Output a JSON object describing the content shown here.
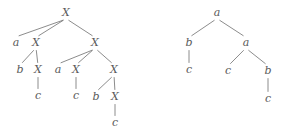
{
  "figure": {
    "background_color": "#ffffff",
    "ink_color": "#5a5a5a",
    "edge_color": "#6e6e6e"
  },
  "trees": [
    {
      "name": "left-tree",
      "nodes": [
        {
          "id": "L0",
          "label": "X",
          "x": 66,
          "y": 13
        },
        {
          "id": "L1",
          "label": "a",
          "x": 16,
          "y": 43
        },
        {
          "id": "L2",
          "label": "X",
          "x": 36,
          "y": 43
        },
        {
          "id": "L3",
          "label": "X",
          "x": 95,
          "y": 43
        },
        {
          "id": "L4",
          "label": "b",
          "x": 20,
          "y": 70
        },
        {
          "id": "L5",
          "label": "X",
          "x": 38,
          "y": 70
        },
        {
          "id": "L6",
          "label": "c",
          "x": 38,
          "y": 96
        },
        {
          "id": "L7",
          "label": "a",
          "x": 58,
          "y": 70
        },
        {
          "id": "L8",
          "label": "X",
          "x": 76,
          "y": 70
        },
        {
          "id": "L9",
          "label": "c",
          "x": 76,
          "y": 96
        },
        {
          "id": "L10",
          "label": "X",
          "x": 114,
          "y": 70
        },
        {
          "id": "L11",
          "label": "b",
          "x": 96,
          "y": 97
        },
        {
          "id": "L12",
          "label": "X",
          "x": 115,
          "y": 97
        },
        {
          "id": "L13",
          "label": "c",
          "x": 115,
          "y": 123
        }
      ],
      "edges": [
        {
          "from": "L0",
          "to": "L1"
        },
        {
          "from": "L0",
          "to": "L2"
        },
        {
          "from": "L0",
          "to": "L3"
        },
        {
          "from": "L2",
          "to": "L4"
        },
        {
          "from": "L2",
          "to": "L5"
        },
        {
          "from": "L5",
          "to": "L6"
        },
        {
          "from": "L3",
          "to": "L7"
        },
        {
          "from": "L3",
          "to": "L8"
        },
        {
          "from": "L3",
          "to": "L10"
        },
        {
          "from": "L8",
          "to": "L9"
        },
        {
          "from": "L10",
          "to": "L11"
        },
        {
          "from": "L10",
          "to": "L12"
        },
        {
          "from": "L12",
          "to": "L13"
        }
      ]
    },
    {
      "name": "right-tree",
      "nodes": [
        {
          "id": "R0",
          "label": "a",
          "x": 217,
          "y": 13
        },
        {
          "id": "R1",
          "label": "b",
          "x": 189,
          "y": 43
        },
        {
          "id": "R2",
          "label": "a",
          "x": 246,
          "y": 43
        },
        {
          "id": "R3",
          "label": "c",
          "x": 189,
          "y": 70
        },
        {
          "id": "R4",
          "label": "c",
          "x": 228,
          "y": 71
        },
        {
          "id": "R5",
          "label": "b",
          "x": 268,
          "y": 71
        },
        {
          "id": "R6",
          "label": "c",
          "x": 268,
          "y": 99
        }
      ],
      "edges": [
        {
          "from": "R0",
          "to": "R1"
        },
        {
          "from": "R0",
          "to": "R2"
        },
        {
          "from": "R1",
          "to": "R3"
        },
        {
          "from": "R2",
          "to": "R4"
        },
        {
          "from": "R2",
          "to": "R5"
        },
        {
          "from": "R5",
          "to": "R6"
        }
      ]
    }
  ]
}
